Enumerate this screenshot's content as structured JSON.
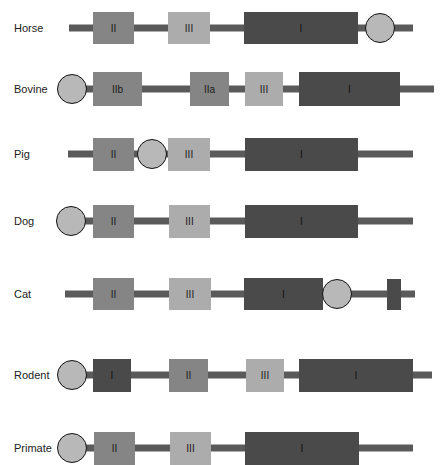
{
  "colors": {
    "line": "#5a5a5a",
    "exon_I": "#4a4a4a",
    "exon_II": "#858585",
    "exon_III": "#acacac",
    "circle_fill": "#b8b8b8",
    "circle_stroke": "#111111"
  },
  "rows": [
    {
      "species": "Horse",
      "y": 28,
      "line": [
        69,
        413
      ],
      "boxes": [
        {
          "label": "II",
          "type": "II",
          "x0": 93,
          "x1": 134,
          "h": 32
        },
        {
          "label": "III",
          "type": "III",
          "x0": 168,
          "x1": 210,
          "h": 32
        },
        {
          "label": "I",
          "type": "I",
          "x0": 244,
          "x1": 358,
          "h": 32
        }
      ],
      "circles": [
        {
          "cx": 380,
          "r": 15
        }
      ]
    },
    {
      "species": "Bovine",
      "y": 89,
      "line": [
        72,
        434
      ],
      "boxes": [
        {
          "label": "IIb",
          "type": "IIb",
          "x0": 93,
          "x1": 142,
          "h": 34
        },
        {
          "label": "IIa",
          "type": "IIa",
          "x0": 190,
          "x1": 229,
          "h": 34
        },
        {
          "label": "III",
          "type": "III",
          "x0": 245,
          "x1": 283,
          "h": 34
        },
        {
          "label": "I",
          "type": "I",
          "x0": 299,
          "x1": 400,
          "h": 34
        }
      ],
      "circles": [
        {
          "cx": 72,
          "r": 15
        }
      ]
    },
    {
      "species": "Pig",
      "y": 154,
      "line": [
        68,
        413
      ],
      "boxes": [
        {
          "label": "II",
          "type": "II",
          "x0": 93,
          "x1": 134,
          "h": 33
        },
        {
          "label": "III",
          "type": "III",
          "x0": 168,
          "x1": 210,
          "h": 33
        },
        {
          "label": "I",
          "type": "I",
          "x0": 245,
          "x1": 358,
          "h": 33
        }
      ],
      "circles": [
        {
          "cx": 152,
          "r": 15
        }
      ]
    },
    {
      "species": "Dog",
      "y": 221,
      "line": [
        71,
        413
      ],
      "boxes": [
        {
          "label": "II",
          "type": "II",
          "x0": 93,
          "x1": 134,
          "h": 33
        },
        {
          "label": "III",
          "type": "III",
          "x0": 169,
          "x1": 210,
          "h": 33
        },
        {
          "label": "I",
          "type": "I",
          "x0": 245,
          "x1": 358,
          "h": 33
        }
      ],
      "circles": [
        {
          "cx": 71,
          "r": 15
        }
      ]
    },
    {
      "species": "Cat",
      "y": 294,
      "line": [
        65,
        415
      ],
      "boxes": [
        {
          "label": "II",
          "type": "II",
          "x0": 93,
          "x1": 134,
          "h": 32
        },
        {
          "label": "III",
          "type": "III",
          "x0": 169,
          "x1": 211,
          "h": 32
        },
        {
          "label": "I",
          "type": "I",
          "x0": 244,
          "x1": 323,
          "h": 32
        },
        {
          "label": "",
          "type": "X",
          "x0": 387,
          "x1": 401,
          "h": 31
        }
      ],
      "circles": [
        {
          "cx": 337,
          "r": 15
        }
      ]
    },
    {
      "species": "Rodent",
      "y": 375,
      "line": [
        72,
        432
      ],
      "boxes": [
        {
          "label": "I",
          "type": "I",
          "x0": 93,
          "x1": 131,
          "h": 33
        },
        {
          "label": "II",
          "type": "II",
          "x0": 169,
          "x1": 208,
          "h": 33
        },
        {
          "label": "III",
          "type": "III",
          "x0": 246,
          "x1": 284,
          "h": 33
        },
        {
          "label": "I",
          "type": "I",
          "x0": 299,
          "x1": 413,
          "h": 33
        }
      ],
      "circles": [
        {
          "cx": 72,
          "r": 15
        }
      ]
    },
    {
      "species": "Primate",
      "y": 448,
      "line": [
        72,
        413
      ],
      "boxes": [
        {
          "label": "II",
          "type": "II",
          "x0": 94,
          "x1": 135,
          "h": 33
        },
        {
          "label": "III",
          "type": "III",
          "x0": 170,
          "x1": 211,
          "h": 33
        },
        {
          "label": "I",
          "type": "I",
          "x0": 245,
          "x1": 359,
          "h": 33
        }
      ],
      "circles": [
        {
          "cx": 72,
          "r": 15
        }
      ]
    }
  ]
}
